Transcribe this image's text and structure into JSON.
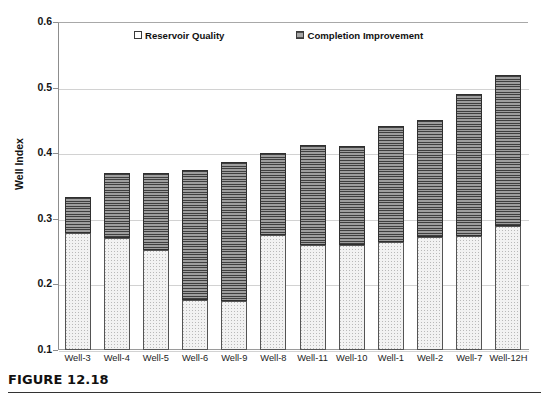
{
  "figure": {
    "caption": "FIGURE 12.18"
  },
  "chart_data": {
    "type": "bar",
    "subtype": "stacked-vertical",
    "title": "",
    "xlabel": "",
    "ylabel": "Well Index",
    "ylim": [
      0.1,
      0.6
    ],
    "ytick_labels": [
      "0.6",
      "0.5",
      "0.4",
      "0.3",
      "0.2",
      "0.1"
    ],
    "ytick_values": [
      0.6,
      0.5,
      0.4,
      0.3,
      0.2,
      0.1
    ],
    "grid": "horizontal",
    "legend_position": "top-inside",
    "categories": [
      "Well-3",
      "Well-4",
      "Well-5",
      "Well-6",
      "Well-9",
      "Well-8",
      "Well-11",
      "Well-10",
      "Well-1",
      "Well-2",
      "Well-7",
      "Well-12H"
    ],
    "series": [
      {
        "name": "Reservoir Quality",
        "pattern": "dotted-light",
        "color": "#f2f2f2",
        "values": [
          0.278,
          0.27,
          0.253,
          0.177,
          0.174,
          0.276,
          0.26,
          0.26,
          0.265,
          0.273,
          0.274,
          0.289
        ]
      },
      {
        "name": "Completion Improvement",
        "pattern": "horizontal-stripes-dark",
        "color": "#8f8f8f",
        "values": [
          0.055,
          0.1,
          0.117,
          0.197,
          0.213,
          0.124,
          0.152,
          0.151,
          0.177,
          0.177,
          0.217,
          0.231
        ]
      }
    ],
    "totals": [
      0.333,
      0.37,
      0.37,
      0.374,
      0.387,
      0.4,
      0.412,
      0.411,
      0.442,
      0.45,
      0.491,
      0.52
    ]
  }
}
